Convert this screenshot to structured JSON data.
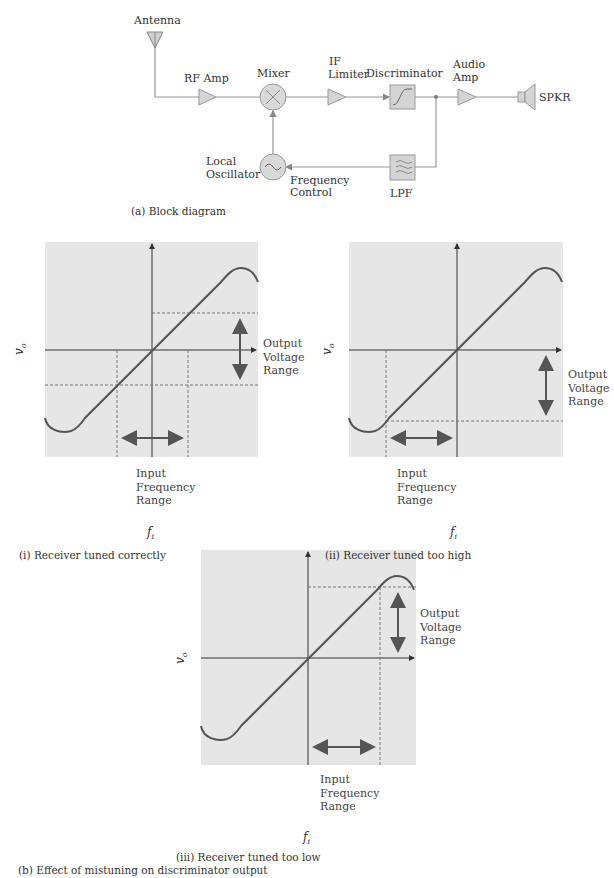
{
  "block_diagram": {
    "caption": "(a) Block diagram",
    "blocks": {
      "antenna": "Antenna",
      "rf_amp": "RF Amp",
      "mixer": "Mixer",
      "if_limiter_line1": "IF",
      "if_limiter_line2": "Limiter",
      "discriminator": "Discriminator",
      "audio_amp_line1": "Audio",
      "audio_amp_line2": "Amp",
      "speaker": "SPKR",
      "local_osc_line1": "Local",
      "local_osc_line2": "Oscillator",
      "freq_control_line1": "Frequency",
      "freq_control_line2": "Control",
      "lpf": "LPF"
    }
  },
  "discriminator_plots": {
    "caption": "(b) Effect of mistuning on discriminator output",
    "y_axis_label": "v",
    "y_axis_sub": "o",
    "x_axis_label": "f",
    "x_axis_sub": "i",
    "output_range_label": [
      "Output",
      "Voltage",
      "Range"
    ],
    "input_range_label": [
      "Input",
      "Frequency",
      "Range"
    ],
    "panels": [
      {
        "id": "i",
        "caption": "(i) Receiver tuned correctly"
      },
      {
        "id": "ii",
        "caption": "(ii) Receiver tuned too high"
      },
      {
        "id": "iii",
        "caption": "(iii) Receiver tuned too low"
      }
    ]
  },
  "colors": {
    "panel_bg": "#e6e6e6",
    "line": "#666666",
    "block_fill": "#d4d4d4"
  }
}
